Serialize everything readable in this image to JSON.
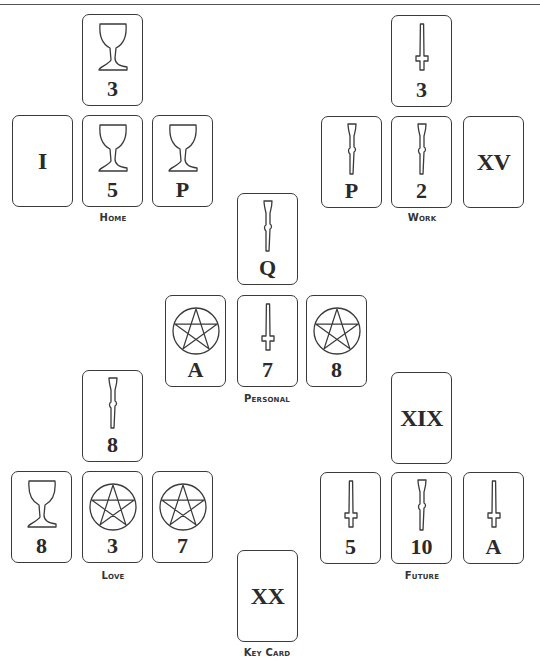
{
  "colors": {
    "stroke": "#3a3a3a",
    "text": "#2a2a2a",
    "background": "#ffffff"
  },
  "groups": [
    {
      "name": "Home",
      "label": "Home",
      "cards": [
        {
          "position": "top",
          "suit": "cups",
          "icon": "cup-icon",
          "value": "3"
        },
        {
          "position": "left",
          "suit": "major",
          "icon": "",
          "value": "I"
        },
        {
          "position": "center",
          "suit": "cups",
          "icon": "cup-icon",
          "value": "5"
        },
        {
          "position": "right",
          "suit": "cups",
          "icon": "cup-icon",
          "value": "P"
        }
      ]
    },
    {
      "name": "Work",
      "label": "Work",
      "cards": [
        {
          "position": "top",
          "suit": "swords",
          "icon": "sword-icon",
          "value": "3"
        },
        {
          "position": "left",
          "suit": "wands",
          "icon": "wand-icon",
          "value": "P"
        },
        {
          "position": "center",
          "suit": "wands",
          "icon": "wand-icon",
          "value": "2"
        },
        {
          "position": "right",
          "suit": "major",
          "icon": "",
          "value": "XV"
        }
      ]
    },
    {
      "name": "Personal",
      "label": "Personal",
      "cards": [
        {
          "position": "top",
          "suit": "wands",
          "icon": "wand-icon",
          "value": "Q"
        },
        {
          "position": "left",
          "suit": "pentacles",
          "icon": "pentacle-icon",
          "value": "A"
        },
        {
          "position": "center",
          "suit": "swords",
          "icon": "sword-icon",
          "value": "7"
        },
        {
          "position": "right",
          "suit": "pentacles",
          "icon": "pentacle-icon",
          "value": "8"
        }
      ]
    },
    {
      "name": "Love",
      "label": "Love",
      "cards": [
        {
          "position": "top",
          "suit": "wands",
          "icon": "wand-icon",
          "value": "8"
        },
        {
          "position": "left",
          "suit": "cups",
          "icon": "cup-icon",
          "value": "8"
        },
        {
          "position": "center",
          "suit": "pentacles",
          "icon": "pentacle-icon",
          "value": "3"
        },
        {
          "position": "right",
          "suit": "pentacles",
          "icon": "pentacle-icon",
          "value": "7"
        }
      ]
    },
    {
      "name": "Future",
      "label": "Future",
      "cards": [
        {
          "position": "top",
          "suit": "major",
          "icon": "",
          "value": "XIX"
        },
        {
          "position": "left",
          "suit": "swords",
          "icon": "sword-icon",
          "value": "5"
        },
        {
          "position": "center",
          "suit": "wands",
          "icon": "wand-icon",
          "value": "10"
        },
        {
          "position": "right",
          "suit": "swords",
          "icon": "sword-icon",
          "value": "A"
        }
      ]
    },
    {
      "name": "Key Card",
      "label": "Key Card",
      "cards": [
        {
          "position": "single",
          "suit": "major",
          "icon": "",
          "value": "XX"
        }
      ]
    }
  ]
}
